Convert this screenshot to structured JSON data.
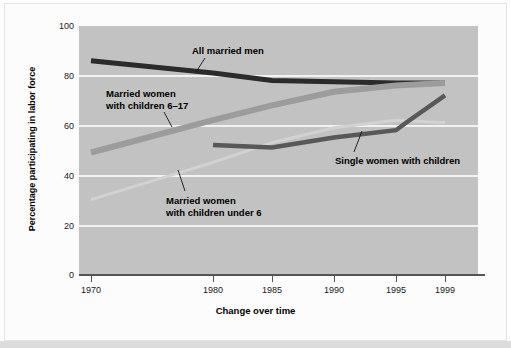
{
  "chart_data": {
    "type": "line",
    "title": "",
    "xlabel": "Change over time",
    "ylabel": "Percentage participating in labor force",
    "x_tick_labels": [
      "1970",
      "1980",
      "1985",
      "1990",
      "1995",
      "1999"
    ],
    "y_tick_labels": [
      "0",
      "20",
      "40",
      "60",
      "80",
      "100"
    ],
    "ylim": [
      0,
      100
    ],
    "grid": "horizontal",
    "legend": "inline-annotations",
    "series": [
      {
        "name": "All married men",
        "color": "#2b2b2b",
        "x": [
          "1970",
          "1980",
          "1985",
          "1990",
          "1995",
          "1999"
        ],
        "values": [
          86,
          81,
          78,
          77.5,
          77,
          77
        ]
      },
      {
        "name": "Married women with children 6–17",
        "color": "#9c9c9c",
        "x": [
          "1970",
          "1980",
          "1985",
          "1990",
          "1995",
          "1999"
        ],
        "values": [
          49,
          62,
          68,
          73.5,
          76,
          77
        ]
      },
      {
        "name": "Married women with children under 6",
        "color": "#d2d2d2",
        "x": [
          "1970",
          "1980",
          "1985",
          "1990",
          "1995",
          "1999"
        ],
        "values": [
          30,
          45,
          53,
          59,
          62,
          61
        ]
      },
      {
        "name": "Single women with children",
        "color": "#585858",
        "x": [
          "1980",
          "1985",
          "1990",
          "1995",
          "1996",
          "1999"
        ],
        "values": [
          52,
          51,
          55,
          58,
          61,
          72
        ]
      }
    ],
    "annotations": [
      {
        "id": "all-married-men",
        "text": "All married men"
      },
      {
        "id": "mw-617",
        "line1": "Married women",
        "line2": "with children 6–17"
      },
      {
        "id": "mw-under6",
        "line1": "Married women",
        "line2": "with children under 6"
      },
      {
        "id": "single-women",
        "text": "Single women with children"
      }
    ]
  },
  "axis": {
    "x_title": "Change over time",
    "y_title": "Percentage participating in labor force",
    "x_ticks": [
      "1970",
      "1980",
      "1985",
      "1990",
      "1995",
      "1999"
    ],
    "y_ticks": [
      "100",
      "80",
      "60",
      "40",
      "20",
      "0"
    ]
  },
  "annotations": {
    "all_married_men": "All married men",
    "married_women_617_line1": "Married women",
    "married_women_617_line2": "with children 6–17",
    "married_women_under6_line1": "Married women",
    "married_women_under6_line2": "with children under 6",
    "single_women": "Single women with children"
  },
  "colors": {
    "plot_background": "#c2c2c2",
    "page_background": "#ffffff",
    "gridline": "#f2f2f2",
    "axis": "#555555",
    "all_married_men": "#2b2b2b",
    "married_women_617": "#9c9c9c",
    "married_women_under6": "#d2d2d2",
    "single_women": "#585858"
  }
}
